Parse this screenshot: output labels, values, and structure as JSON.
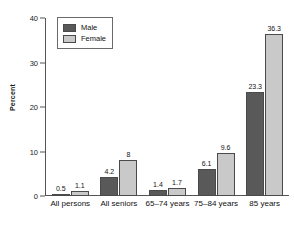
{
  "chart_data": {
    "type": "bar",
    "title": "",
    "xlabel": "",
    "ylabel": "Percent",
    "ylim": [
      0,
      40
    ],
    "yticks": [
      0,
      10,
      20,
      30,
      40
    ],
    "grid": false,
    "legend_position": "upper-left-inside",
    "categories": [
      "All persons",
      "All seniors",
      "65–74 years",
      "75–84 years",
      "85 years"
    ],
    "series": [
      {
        "name": "Male",
        "color": "#595959",
        "values": [
          0.5,
          4.2,
          1.4,
          6.1,
          23.3
        ],
        "labels": [
          "0.5",
          "4.2",
          "1.4",
          "6.1",
          "23.3"
        ]
      },
      {
        "name": "Female",
        "color": "#c9c9c9",
        "values": [
          1.1,
          8,
          1.7,
          9.6,
          36.3
        ],
        "labels": [
          "1.1",
          "8",
          "1.7",
          "9.6",
          "36.3"
        ]
      }
    ]
  },
  "legend": {
    "items": [
      {
        "label": "Male",
        "swatch": "male"
      },
      {
        "label": "Female",
        "swatch": "female"
      }
    ]
  },
  "axis": {
    "y_title": "Percent",
    "y_tick_labels": [
      "40",
      "30",
      "20",
      "10",
      "0"
    ]
  }
}
